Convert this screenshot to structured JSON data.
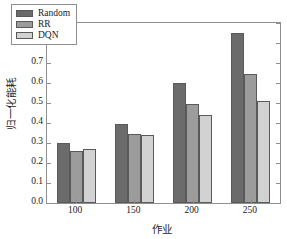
{
  "chart_data": {
    "type": "bar",
    "title": "",
    "xlabel": "作业",
    "ylabel": "归一化能耗",
    "categories": [
      "100",
      "150",
      "200",
      "250"
    ],
    "series": [
      {
        "name": "Random",
        "color": "#6b6b6b",
        "values": [
          0.3,
          0.395,
          0.6,
          0.85
        ]
      },
      {
        "name": "RR",
        "color": "#9c9c9c",
        "values": [
          0.26,
          0.345,
          0.495,
          0.645
        ]
      },
      {
        "name": "DQN",
        "color": "#d2d2d2",
        "values": [
          0.27,
          0.338,
          0.44,
          0.51
        ]
      }
    ],
    "ylim": [
      0.0,
      0.9
    ],
    "ytick_labels": [
      "0.0",
      "0.1",
      "0.2",
      "0.3",
      "0.4",
      "0.5",
      "0.6",
      "0.7",
      "0.8",
      "0.9"
    ],
    "ytick_values": [
      0.0,
      0.1,
      0.2,
      0.3,
      0.4,
      0.5,
      0.6,
      0.7,
      0.8,
      0.9
    ],
    "grid": false,
    "legend_position": "upper-left",
    "frame": true,
    "tick_direction": "in"
  },
  "legend": {
    "entries": [
      {
        "label": "Random",
        "color": "#6b6b6b"
      },
      {
        "label": "RR",
        "color": "#9c9c9c"
      },
      {
        "label": "DQN",
        "color": "#d2d2d2"
      }
    ]
  },
  "axes": {
    "frame_color": "#8f8f8f",
    "bar_edge_color": "#5a5a5a"
  }
}
